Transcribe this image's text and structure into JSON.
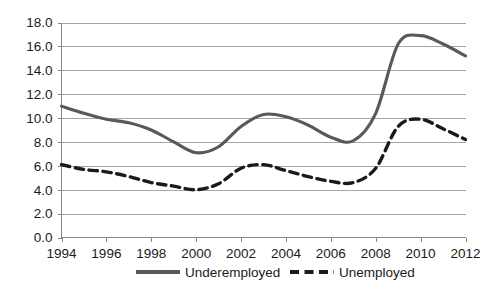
{
  "chart_data": {
    "type": "line",
    "title": "",
    "subtitle": "",
    "xlabel": "",
    "ylabel": "",
    "xlim": [
      1994,
      2012
    ],
    "ylim": [
      0.0,
      18.0
    ],
    "grid": true,
    "legend_position": "bottom",
    "x": [
      1994,
      1995,
      1996,
      1997,
      1998,
      1999,
      2000,
      2001,
      2002,
      2003,
      2004,
      2005,
      2006,
      2007,
      2008,
      2009,
      2010,
      2011,
      2012
    ],
    "x_tick_labels": [
      "1994",
      "1996",
      "1998",
      "2000",
      "2002",
      "2004",
      "2006",
      "2008",
      "2010",
      "2012"
    ],
    "x_ticks": [
      1994,
      1996,
      1998,
      2000,
      2002,
      2004,
      2006,
      2008,
      2010,
      2012
    ],
    "y_ticks": [
      0.0,
      2.0,
      4.0,
      6.0,
      8.0,
      10.0,
      12.0,
      14.0,
      16.0,
      18.0
    ],
    "y_tick_labels": [
      "0.0",
      "2.0",
      "4.0",
      "6.0",
      "8.0",
      "10.0",
      "12.0",
      "14.0",
      "16.0",
      "18.0"
    ],
    "series": [
      {
        "name": "Underemployed",
        "style": "solid",
        "color": "#595959",
        "values": [
          11.0,
          10.4,
          9.9,
          9.6,
          9.0,
          8.0,
          7.1,
          7.6,
          9.3,
          10.3,
          10.1,
          9.4,
          8.4,
          8.1,
          10.4,
          16.2,
          16.9,
          16.2,
          15.2
        ]
      },
      {
        "name": "Unemployed",
        "style": "dashed",
        "color": "#1a1a1a",
        "values": [
          6.1,
          5.7,
          5.5,
          5.1,
          4.6,
          4.3,
          4.0,
          4.5,
          5.8,
          6.1,
          5.6,
          5.1,
          4.7,
          4.6,
          5.8,
          9.3,
          9.9,
          9.1,
          8.2
        ]
      }
    ],
    "legend": [
      {
        "label": "Underemployed",
        "style": "solid",
        "color": "#595959"
      },
      {
        "label": "Unemployed",
        "style": "dashed",
        "color": "#1a1a1a"
      }
    ]
  }
}
